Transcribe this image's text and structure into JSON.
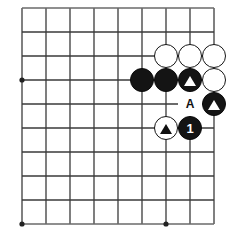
{
  "diagram": {
    "kind": "go-board-problem",
    "board": {
      "columns": 9,
      "rows": 10,
      "spacing": 24,
      "origin_x": 22,
      "origin_y": 8,
      "line_color": "#3a3a3a",
      "edge_color": "#6a6a6a",
      "background_color": "#ffffff",
      "star_points": [
        {
          "col": 0,
          "row": 3
        },
        {
          "col": 0,
          "row": 9
        },
        {
          "col": 6,
          "row": 9
        }
      ]
    },
    "stones": [
      {
        "id": "w-c6r2",
        "color": "white",
        "col": 6,
        "row": 2,
        "marker": "none",
        "label": ""
      },
      {
        "id": "w-c7r2",
        "color": "white",
        "col": 7,
        "row": 2,
        "marker": "none",
        "label": ""
      },
      {
        "id": "w-c8r2",
        "color": "white",
        "col": 8,
        "row": 2,
        "marker": "none",
        "label": ""
      },
      {
        "id": "b-c5r3",
        "color": "black",
        "col": 5,
        "row": 3,
        "marker": "none",
        "label": ""
      },
      {
        "id": "b-c6r3",
        "color": "black",
        "col": 6,
        "row": 3,
        "marker": "none",
        "label": ""
      },
      {
        "id": "b-c7r3",
        "color": "black",
        "col": 7,
        "row": 3,
        "marker": "triangle",
        "label": ""
      },
      {
        "id": "w-c8r3",
        "color": "white",
        "col": 8,
        "row": 3,
        "marker": "none",
        "label": ""
      },
      {
        "id": "b-c8r4",
        "color": "black",
        "col": 8,
        "row": 4,
        "marker": "triangle",
        "label": ""
      },
      {
        "id": "w-c6r5",
        "color": "white",
        "col": 6,
        "row": 5,
        "marker": "triangle",
        "label": ""
      },
      {
        "id": "b-c7r5",
        "color": "black",
        "col": 7,
        "row": 5,
        "marker": "none",
        "label": "1"
      }
    ],
    "point_labels": [
      {
        "id": "label-a",
        "text": "A",
        "col": 7,
        "row": 4
      }
    ]
  }
}
